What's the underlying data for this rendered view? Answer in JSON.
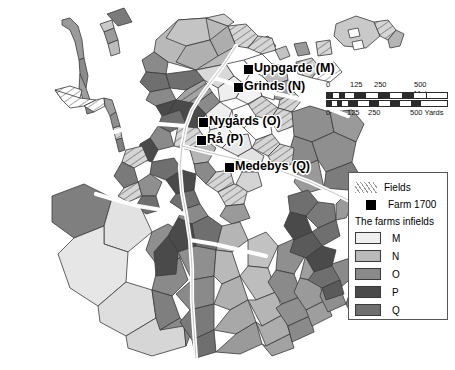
{
  "map": {
    "title": "Village infields map",
    "background": "#ffffff",
    "outline_color": "#3a3a3a",
    "road_color": "#ffffff",
    "farms": [
      {
        "key": "M",
        "label": "Uppgarde (M)",
        "marker_x": 243,
        "marker_y": 64,
        "label_x": 254,
        "label_y": 62
      },
      {
        "key": "N",
        "label": "Grinds (N)",
        "marker_x": 233,
        "marker_y": 82,
        "label_x": 244,
        "label_y": 80
      },
      {
        "key": "O",
        "label": "Nygårds (O)",
        "marker_x": 198,
        "marker_y": 117,
        "label_x": 209,
        "label_y": 115
      },
      {
        "key": "P",
        "label": "Rå (P)",
        "marker_x": 196,
        "marker_y": 135,
        "label_x": 207,
        "label_y": 133
      },
      {
        "key": "Q",
        "label": "Medebys (Q)",
        "marker_x": 224,
        "marker_y": 162,
        "label_x": 235,
        "label_y": 160
      }
    ]
  },
  "scalebar": {
    "metres_unit": "500 Metres",
    "yards_unit": "500 Yards",
    "metres_ticks": [
      "0",
      "125",
      "250"
    ],
    "yards_ticks": [
      "0",
      "125",
      "250"
    ],
    "tick_positions": [
      0,
      25,
      50,
      100
    ]
  },
  "legend": {
    "fields_label": "Fields",
    "farm_label": "Farm 1700",
    "infields_title": "The farms infields",
    "keys": [
      {
        "label": "M",
        "color": "#efefef"
      },
      {
        "label": "N",
        "color": "#b9b9b9"
      },
      {
        "label": "O",
        "color": "#8a8a8a"
      },
      {
        "label": "P",
        "color": "#4a4a4a"
      },
      {
        "label": "Q",
        "color": "#6f6f6f"
      }
    ]
  },
  "palette": {
    "M": "#efefef",
    "N": "#b9b9b9",
    "O": "#8a8a8a",
    "P": "#4a4a4a",
    "Q": "#6f6f6f",
    "white": "#ffffff",
    "hatch_line": "#9a9a9a",
    "stroke": "#3a3a3a"
  }
}
